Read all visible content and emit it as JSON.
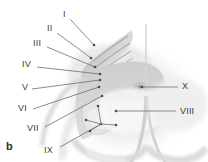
{
  "figure": {
    "panel_letter": "b",
    "image_type": "grayscale-histological-micrograph",
    "background_color": "#ffffff",
    "tissue_color_light": "#e6e6e6",
    "tissue_color_mid": "#c9c9c9",
    "tissue_color_dark": "#a8a8a8",
    "leader_line_color": "#6e6e6e",
    "label_color": "#3b3b3b"
  },
  "labels": [
    {
      "id": "label-I",
      "text": "I",
      "x": 63,
      "y": 10,
      "side": "left",
      "leader_from": [
        70,
        19
      ],
      "leader_to": [
        94,
        45
      ]
    },
    {
      "id": "label-II",
      "text": "II",
      "x": 47,
      "y": 24,
      "side": "left",
      "leader_from": [
        57,
        33
      ],
      "leader_to": [
        91,
        58
      ]
    },
    {
      "id": "label-III",
      "text": "III",
      "x": 33,
      "y": 39,
      "side": "left",
      "leader_from": [
        47,
        47
      ],
      "leader_to": [
        95,
        67
      ]
    },
    {
      "id": "label-IV",
      "text": "IV",
      "x": 22,
      "y": 60,
      "side": "left",
      "leader_from": [
        37,
        67
      ],
      "leader_to": [
        100,
        74
      ]
    },
    {
      "id": "label-V",
      "text": "V",
      "x": 22,
      "y": 83,
      "side": "left",
      "leader_from": [
        32,
        89
      ],
      "leader_to": [
        100,
        80
      ]
    },
    {
      "id": "label-VI",
      "text": "VI",
      "x": 18,
      "y": 104,
      "side": "left",
      "leader_from": [
        33,
        109
      ],
      "leader_to": [
        99,
        87
      ]
    },
    {
      "id": "label-VII",
      "text": "VII",
      "x": 27,
      "y": 124,
      "side": "left",
      "leader_from": [
        45,
        127
      ],
      "leader_to": [
        102,
        96
      ]
    },
    {
      "id": "label-IX",
      "text": "IX",
      "x": 44,
      "y": 146,
      "side": "left",
      "leader_from": [
        60,
        147
      ],
      "leader_to": [
        101,
        124
      ]
    },
    {
      "id": "label-X",
      "text": "X",
      "x": 182,
      "y": 82,
      "side": "right",
      "leader_from": [
        178,
        87
      ],
      "leader_to": [
        142,
        87
      ]
    },
    {
      "id": "label-VIII",
      "text": "VIII",
      "x": 180,
      "y": 107,
      "side": "right",
      "leader_from": [
        176,
        111
      ],
      "leader_to": [
        116,
        111
      ]
    }
  ],
  "internal_pointers": {
    "description": "fan of short arrow stems inside region IX",
    "hub": [
      101,
      124
    ],
    "tips": [
      [
        98,
        106
      ],
      [
        86,
        120
      ],
      [
        90,
        131
      ],
      [
        116,
        125
      ]
    ]
  }
}
